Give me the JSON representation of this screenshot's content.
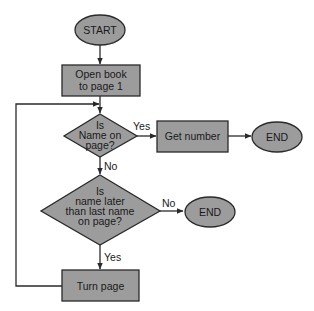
{
  "colors": {
    "fill": "#9c9c9c",
    "stroke": "#2a2a2a",
    "text": "#1a1a1a",
    "background": "#ffffff"
  },
  "nodes": {
    "start": {
      "type": "terminal",
      "lines": [
        "START"
      ]
    },
    "open_book": {
      "type": "process",
      "lines": [
        "Open book",
        "to page 1"
      ]
    },
    "is_name_on_page": {
      "type": "decision",
      "lines": [
        "Is",
        "Name on",
        "page?"
      ]
    },
    "get_number": {
      "type": "process",
      "lines": [
        "Get number"
      ]
    },
    "end_1": {
      "type": "terminal",
      "lines": [
        "END"
      ]
    },
    "is_name_later": {
      "type": "decision",
      "lines": [
        "Is",
        "name later",
        "than last name",
        "on page?"
      ]
    },
    "end_2": {
      "type": "terminal",
      "lines": [
        "END"
      ]
    },
    "turn_page": {
      "type": "process",
      "lines": [
        "Turn page"
      ]
    }
  },
  "edges": [
    {
      "from": "start",
      "to": "open_book",
      "label": ""
    },
    {
      "from": "open_book",
      "to": "is_name_on_page",
      "label": ""
    },
    {
      "from": "is_name_on_page",
      "to": "get_number",
      "label": "Yes"
    },
    {
      "from": "get_number",
      "to": "end_1",
      "label": ""
    },
    {
      "from": "is_name_on_page",
      "to": "is_name_later",
      "label": "No"
    },
    {
      "from": "is_name_later",
      "to": "end_2",
      "label": "No"
    },
    {
      "from": "is_name_later",
      "to": "turn_page",
      "label": "Yes"
    },
    {
      "from": "turn_page",
      "to": "is_name_on_page",
      "label": ""
    }
  ]
}
